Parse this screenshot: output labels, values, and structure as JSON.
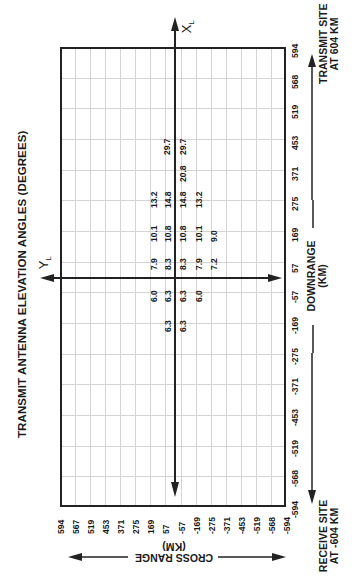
{
  "chart_data": {
    "type": "table",
    "title": "TRANSMIT ANTENNA ELEVATION ANGLES (DEGREES)",
    "xlabel": "CROSS RANGE (KM)",
    "ylabel": "DOWNRANGE (KM)",
    "x_ticks": [
      "594",
      "567",
      "519",
      "453",
      "371",
      "275",
      "169",
      "57",
      "-57",
      "-169",
      "-275",
      "-371",
      "-453",
      "-519",
      "-568",
      "-594"
    ],
    "y_ticks": [
      "594",
      "568",
      "519",
      "453",
      "371",
      "275",
      "169",
      "57",
      "-57",
      "-169",
      "-275",
      "-371",
      "-453",
      "-519",
      "-568",
      "-594"
    ],
    "axis_labels": {
      "x_local": "X",
      "x_local_sub": "L",
      "y_local": "Y",
      "y_local_sub": "L"
    },
    "annotations": {
      "transmit_site": [
        "TRANSMIT SITE",
        "AT 604 KM"
      ],
      "receive_site": [
        "RECEIVE SITE",
        "AT -604 KM"
      ]
    },
    "grid": true,
    "rows": [
      {
        "downrange": "453",
        "values": [
          "29.7",
          "29.7"
        ]
      },
      {
        "downrange": "371",
        "values": [
          "20.8"
        ]
      },
      {
        "downrange": "275",
        "values": [
          "13.2",
          "14.8",
          "14.8",
          "13.2"
        ]
      },
      {
        "downrange": "169",
        "values": [
          "10.1",
          "10.8",
          "10.8",
          "10.1",
          "9.0"
        ]
      },
      {
        "downrange": "57",
        "values": [
          "7.9",
          "8.3",
          "8.3",
          "7.9",
          "7.2"
        ]
      },
      {
        "downrange": "-57",
        "values": [
          "6.0",
          "6.3",
          "6.3",
          "6.0"
        ]
      },
      {
        "downrange": "-169",
        "values": [
          "6.3",
          "6.3"
        ]
      }
    ],
    "cells": [
      {
        "v": "29.7",
        "x": 167,
        "y": 147
      },
      {
        "v": "29.7",
        "x": 183,
        "y": 147
      },
      {
        "v": "20.8",
        "x": 183,
        "y": 174
      },
      {
        "v": "13.2",
        "x": 154,
        "y": 200
      },
      {
        "v": "14.8",
        "x": 168,
        "y": 200
      },
      {
        "v": "14.8",
        "x": 183,
        "y": 200
      },
      {
        "v": "13.2",
        "x": 199,
        "y": 200
      },
      {
        "v": "10.1",
        "x": 154,
        "y": 234
      },
      {
        "v": "10.8",
        "x": 168,
        "y": 234
      },
      {
        "v": "10.8",
        "x": 183,
        "y": 234
      },
      {
        "v": "10.1",
        "x": 199,
        "y": 234
      },
      {
        "v": "9.0",
        "x": 214,
        "y": 234
      },
      {
        "v": "7.9",
        "x": 154,
        "y": 262
      },
      {
        "v": "8.3",
        "x": 168,
        "y": 262
      },
      {
        "v": "8.3",
        "x": 183,
        "y": 262
      },
      {
        "v": "7.9",
        "x": 199,
        "y": 262
      },
      {
        "v": "7.2",
        "x": 214,
        "y": 262
      },
      {
        "v": "6.0",
        "x": 154,
        "y": 294
      },
      {
        "v": "6.3",
        "x": 168,
        "y": 294
      },
      {
        "v": "6.3",
        "x": 183,
        "y": 294
      },
      {
        "v": "6.0",
        "x": 199,
        "y": 294
      },
      {
        "v": "6.3",
        "x": 168,
        "y": 324
      },
      {
        "v": "6.3",
        "x": 183,
        "y": 324
      }
    ]
  }
}
